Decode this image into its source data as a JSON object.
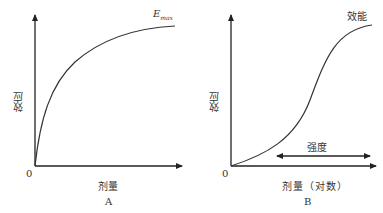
{
  "panel_a": {
    "label": "A",
    "y_axis_label": "效应",
    "x_axis_label": "剂量",
    "origin_label": "0",
    "curve_label_main": "E",
    "curve_label_sub": "max",
    "curve_type": "hyperbolic"
  },
  "panel_b": {
    "label": "B",
    "y_axis_label": "效应",
    "x_axis_label": "剂量（对数）",
    "origin_label": "0",
    "curve_label": "效能",
    "range_label": "强度",
    "curve_type": "sigmoid"
  },
  "colors": {
    "axis": "#222222",
    "curve": "#333333",
    "text": "#333333"
  }
}
